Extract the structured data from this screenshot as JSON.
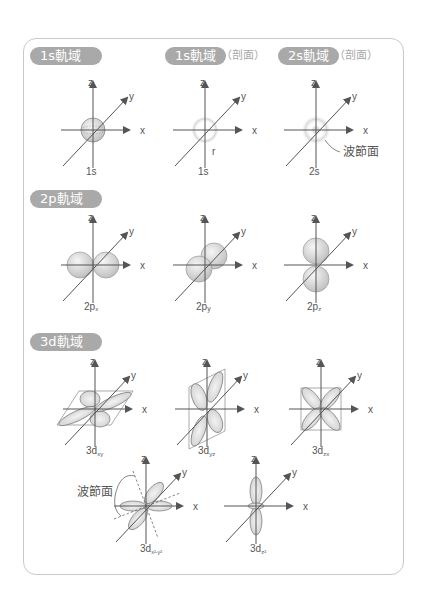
{
  "sections": [
    {
      "badge": "1s軌域",
      "panels": [
        {
          "badge": "1s軌域",
          "caption": "1s",
          "note": ""
        },
        {
          "badge": "1s軌域",
          "badge_suffix": "（剖面）",
          "caption": "1s",
          "radius_label": "r"
        },
        {
          "badge": "2s軌域",
          "badge_suffix": "（剖面）",
          "caption": "2s",
          "node_label": "波節面"
        }
      ]
    },
    {
      "badge": "2p軌域",
      "panels": [
        {
          "caption": "2p",
          "sub": "x"
        },
        {
          "caption": "2p",
          "sub": "y"
        },
        {
          "caption": "2p",
          "sub": "z"
        }
      ]
    },
    {
      "badge": "3d軌域",
      "panels": [
        {
          "caption": "3d",
          "sub": "xy"
        },
        {
          "caption": "3d",
          "sub": "yz"
        },
        {
          "caption": "3d",
          "sub": "zx"
        },
        {
          "caption": "3d",
          "sub": "x²-y²",
          "node_label": "波節面"
        },
        {
          "caption": "3d",
          "sub": "z²"
        }
      ]
    }
  ],
  "axes": {
    "x": "x",
    "y": "y",
    "z": "z"
  },
  "colors": {
    "badge_bg": "#a9a9a9",
    "badge_text": "#ffffff",
    "frame_border": "#c9c9c9",
    "axis": "#555555",
    "lobe_fill": "#e2e2e2"
  }
}
